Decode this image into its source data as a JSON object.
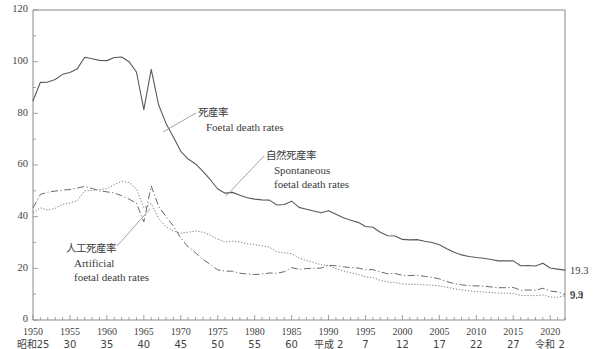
{
  "chart_data": {
    "type": "line",
    "title": "",
    "xlabel": "",
    "ylabel": "",
    "ylim": [
      0,
      120
    ],
    "xlim": [
      1950,
      2022
    ],
    "grid": false,
    "legend_position": "inline-annotations",
    "y_ticks": [
      0,
      20,
      40,
      60,
      80,
      100,
      120
    ],
    "y_minor_step": 10,
    "x_ticks": [
      1950,
      1955,
      1960,
      1965,
      1970,
      1975,
      1980,
      1985,
      1990,
      1995,
      2000,
      2005,
      2010,
      2015,
      2020
    ],
    "x_tick_eras": [
      "昭和25",
      "30",
      "35",
      "40",
      "45",
      "50",
      "55",
      "60",
      "平成 2",
      "7",
      "12",
      "17",
      "22",
      "27",
      "令和 2"
    ],
    "x": [
      1950,
      1951,
      1952,
      1953,
      1954,
      1955,
      1956,
      1957,
      1958,
      1959,
      1960,
      1961,
      1962,
      1963,
      1964,
      1965,
      1966,
      1967,
      1968,
      1969,
      1970,
      1971,
      1972,
      1973,
      1974,
      1975,
      1976,
      1977,
      1978,
      1979,
      1980,
      1981,
      1982,
      1983,
      1984,
      1985,
      1986,
      1987,
      1988,
      1989,
      1990,
      1991,
      1992,
      1993,
      1994,
      1995,
      1996,
      1997,
      1998,
      1999,
      2000,
      2001,
      2002,
      2003,
      2004,
      2005,
      2006,
      2007,
      2008,
      2009,
      2010,
      2011,
      2012,
      2013,
      2014,
      2015,
      2016,
      2017,
      2018,
      2019,
      2020,
      2021,
      2022
    ],
    "series": [
      {
        "name": "死産率 Foetal death rates",
        "style": "solid",
        "values": [
          84.9,
          92.0,
          92.1,
          93.1,
          95.1,
          95.8,
          97.3,
          101.7,
          101.1,
          100.5,
          100.4,
          101.6,
          101.8,
          100.0,
          96.0,
          81.4,
          97.0,
          83.3,
          76.1,
          70.8,
          65.3,
          62.3,
          60.4,
          57.5,
          54.3,
          50.7,
          49.1,
          49.4,
          48.3,
          47.3,
          46.8,
          46.5,
          46.4,
          44.5,
          44.7,
          46.0,
          43.6,
          42.9,
          42.2,
          41.5,
          42.3,
          40.9,
          39.6,
          38.6,
          37.8,
          36.2,
          35.9,
          34.0,
          32.6,
          32.5,
          31.2,
          31.0,
          31.1,
          30.5,
          30.0,
          29.1,
          27.6,
          26.2,
          25.2,
          24.6,
          24.2,
          23.9,
          23.4,
          22.9,
          22.9,
          22.9,
          21.0,
          21.1,
          20.9,
          22.0,
          20.1,
          19.7,
          19.3
        ]
      },
      {
        "name": "自然死産率 Spontaneous foetal death rates",
        "style": "dashdot",
        "values": [
          43.4,
          48.6,
          49.5,
          49.9,
          50.3,
          50.5,
          51.1,
          51.7,
          50.9,
          50.0,
          49.6,
          49.2,
          48.1,
          46.8,
          45.2,
          38.0,
          51.9,
          44.0,
          40.0,
          36.4,
          31.7,
          28.3,
          26.0,
          23.5,
          21.5,
          19.4,
          18.9,
          18.9,
          18.1,
          17.8,
          17.6,
          17.8,
          18.2,
          18.1,
          18.7,
          20.3,
          19.6,
          19.9,
          20.0,
          20.1,
          21.2,
          21.0,
          20.6,
          20.3,
          20.1,
          19.5,
          19.5,
          18.6,
          17.9,
          18.0,
          17.3,
          17.2,
          17.3,
          16.9,
          16.5,
          15.9,
          14.9,
          14.1,
          13.6,
          13.3,
          13.2,
          13.1,
          12.8,
          12.5,
          12.5,
          12.6,
          11.5,
          11.6,
          11.5,
          12.3,
          11.2,
          10.9,
          9.9
        ]
      },
      {
        "name": "人工死産率 Artificial foetal death rates",
        "style": "dotted",
        "values": [
          41.5,
          43.4,
          42.6,
          43.2,
          44.8,
          45.3,
          46.2,
          50.0,
          50.2,
          50.5,
          50.8,
          52.4,
          53.7,
          53.2,
          50.8,
          43.4,
          45.1,
          39.3,
          36.1,
          34.4,
          33.6,
          34.0,
          34.4,
          34.0,
          32.8,
          31.3,
          30.2,
          30.5,
          30.2,
          29.5,
          29.2,
          28.7,
          28.2,
          26.4,
          26.0,
          25.7,
          24.0,
          23.0,
          22.2,
          21.4,
          21.1,
          19.9,
          19.0,
          18.3,
          17.7,
          16.7,
          16.4,
          15.4,
          14.7,
          14.5,
          13.9,
          13.8,
          13.8,
          13.6,
          13.5,
          13.2,
          12.7,
          12.1,
          11.6,
          11.3,
          11.0,
          10.8,
          10.6,
          10.4,
          10.4,
          10.3,
          9.5,
          9.5,
          9.4,
          9.7,
          8.9,
          8.8,
          9.4
        ]
      }
    ],
    "end_labels": [
      {
        "series": "死産率 Foetal death rates",
        "value": "19.3"
      },
      {
        "series": "自然死産率 Spontaneous foetal death rates",
        "value": "9.9"
      },
      {
        "series": "人工死産率 Artificial foetal death rates",
        "value": "9.4"
      }
    ],
    "annotations": [
      {
        "id": "total",
        "jp": "死産率",
        "en_line1": "Foetal death rates",
        "en_line2": ""
      },
      {
        "id": "spontaneous",
        "jp": "自然死産率",
        "en_line1": "Spontaneous",
        "en_line2": "foetal death rates"
      },
      {
        "id": "artificial",
        "jp": "人工死産率",
        "en_line1": "Artificial",
        "en_line2": "foetal death rates"
      }
    ]
  },
  "colors": {
    "axis": "#8a8a8a",
    "total_line": "#5a5a5a",
    "spontaneous_line": "#6a6a6a",
    "artificial_line": "#7a7a7a",
    "text": "#3b3b3b",
    "background": "#ffffff"
  }
}
